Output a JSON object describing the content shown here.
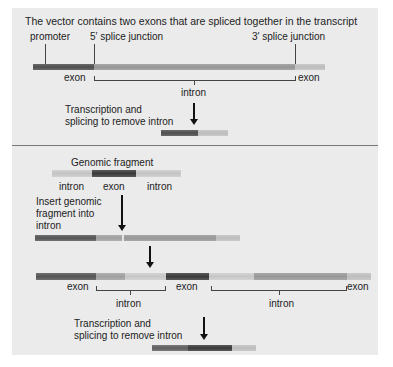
{
  "panel_top": {
    "title": "The vector contains two exons that are spliced together in the transcript",
    "labels": {
      "promoter": "promoter",
      "five_prime": "5′ splice junction",
      "three_prime": "3′ splice junction",
      "exon_left": "exon",
      "exon_right": "exon",
      "intron": "intron",
      "step": "Transcription and\nsplicing to remove intron",
      "step_line1": "Transcription and",
      "step_line2": "splicing to remove intron"
    }
  },
  "panel_bottom": {
    "fragment_title": "Genomic fragment",
    "fragment_labels": [
      "intron",
      "exon",
      "intron"
    ],
    "insert_step_line1": "Insert genomic",
    "insert_step_line2": "fragment into",
    "insert_step_line3": "intron",
    "construct_labels": {
      "exon1": "exon",
      "intron1": "intron",
      "exon2": "exon",
      "intron2": "intron",
      "exon3": "exon"
    },
    "step_line1": "Transcription and",
    "step_line2": "splicing to remove intron"
  },
  "colors": {
    "background": "#ebebeb",
    "exon_dark": "#555555",
    "exon_medium": "#8a8a8a",
    "intron_light": "#c4c4c4",
    "inserted_exon": "#3e3e3e"
  }
}
